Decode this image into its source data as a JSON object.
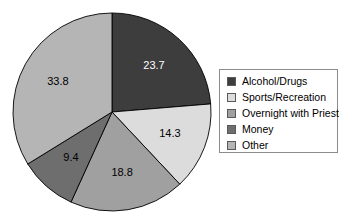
{
  "chart_data": {
    "type": "pie",
    "title": "",
    "subtitle": "",
    "xlabel": "",
    "ylabel": "",
    "legend_position": "right",
    "grid": false,
    "total": 100.0,
    "start_angle_deg": 0,
    "direction": "clockwise",
    "categories": [
      "Alcohol/Drugs",
      "Sports/Recreation",
      "Overnight with Priest",
      "Money",
      "Other"
    ],
    "values": [
      23.7,
      14.3,
      18.8,
      9.4,
      33.8
    ],
    "value_labels": [
      "23.7",
      "14.3",
      "18.8",
      "9.4",
      "33.8"
    ],
    "colors": [
      "#3d3d3d",
      "#dcdcdc",
      "#a0a0a0",
      "#6e6e6e",
      "#b5b5b5"
    ],
    "label_text_colors": [
      "#ffffff",
      "#000000",
      "#000000",
      "#000000",
      "#000000"
    ],
    "slices": [
      {
        "label": "Alcohol/Drugs",
        "value": 23.7,
        "value_label": "23.7",
        "color": "#3d3d3d",
        "text_color": "#ffffff"
      },
      {
        "label": "Sports/Recreation",
        "value": 14.3,
        "value_label": "14.3",
        "color": "#dcdcdc",
        "text_color": "#000000"
      },
      {
        "label": "Overnight with Priest",
        "value": 18.8,
        "value_label": "18.8",
        "color": "#a0a0a0",
        "text_color": "#000000"
      },
      {
        "label": "Money",
        "value": 9.4,
        "value_label": "9.4",
        "color": "#6e6e6e",
        "text_color": "#000000"
      },
      {
        "label": "Other",
        "value": 33.8,
        "value_label": "33.8",
        "color": "#b5b5b5",
        "text_color": "#000000"
      }
    ]
  },
  "legend": {
    "border_color": "#8c8c8c",
    "items": [
      {
        "label": "Alcohol/Drugs",
        "color": "#3d3d3d"
      },
      {
        "label": "Sports/Recreation",
        "color": "#dcdcdc"
      },
      {
        "label": "Overnight with Priest",
        "color": "#a0a0a0"
      },
      {
        "label": "Money",
        "color": "#6e6e6e"
      },
      {
        "label": "Other",
        "color": "#b5b5b5"
      }
    ]
  },
  "geometry": {
    "center_x": 112,
    "center_y": 112,
    "radius": 99,
    "label_radius": 62
  }
}
